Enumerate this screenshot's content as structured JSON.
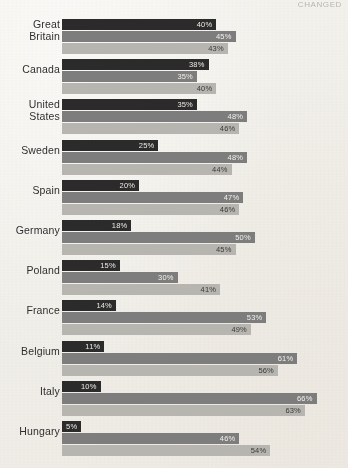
{
  "header": {
    "cropped_text": "CHANGED"
  },
  "chart_data": {
    "type": "bar",
    "orientation": "horizontal",
    "title": "",
    "subtitle": "",
    "xlabel": "",
    "ylabel": "",
    "xlim": [
      0,
      70
    ],
    "grid": false,
    "legend_position": "none",
    "value_suffix": "%",
    "categories": [
      "Great\nBritain",
      "Canada",
      "United\nStates",
      "Sweden",
      "Spain",
      "Germany",
      "Poland",
      "France",
      "Belgium",
      "Italy",
      "Hungary"
    ],
    "series": [
      {
        "name": "series-1",
        "color": "#2b2b2b",
        "values": [
          40,
          38,
          35,
          25,
          20,
          18,
          15,
          14,
          11,
          10,
          5
        ],
        "labels": [
          "40%",
          "38%",
          "35%",
          "25%",
          "20%",
          "18%",
          "15%",
          "14%",
          "11%",
          "10%",
          "5%"
        ]
      },
      {
        "name": "series-2",
        "color": "#7d7d7d",
        "values": [
          45,
          35,
          48,
          48,
          47,
          50,
          30,
          53,
          61,
          66,
          46
        ],
        "labels": [
          "45%",
          "35%",
          "48%",
          "48%",
          "47%",
          "50%",
          "30%",
          "53%",
          "61%",
          "66%",
          "46%"
        ]
      },
      {
        "name": "series-3",
        "color": "#b6b5b0",
        "values": [
          43,
          40,
          46,
          44,
          46,
          45,
          41,
          49,
          56,
          63,
          54
        ],
        "labels": [
          "43%",
          "40%",
          "46%",
          "44%",
          "46%",
          "45%",
          "41%",
          "49%",
          "56%",
          "63%",
          "54%"
        ]
      }
    ]
  },
  "colors": {
    "background": "#f2f0ea",
    "series_dark": "#2b2b2b",
    "series_mid": "#7d7d7d",
    "series_light": "#b6b5b0",
    "label_text": "#2f2f2f"
  }
}
